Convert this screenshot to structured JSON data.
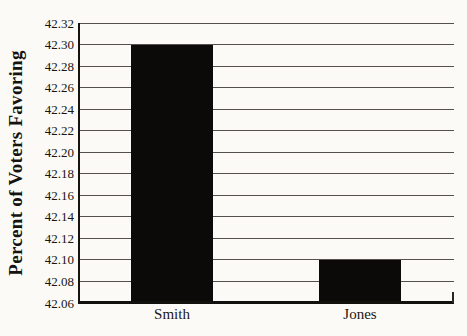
{
  "chart_data": {
    "type": "bar",
    "categories": [
      "Smith",
      "Jones"
    ],
    "values": [
      42.3,
      42.1
    ],
    "title": "",
    "xlabel": "",
    "ylabel": "Percent of Voters Favoring",
    "ylim": [
      42.06,
      42.32
    ],
    "ytick_step": 0.02,
    "yticks": [
      42.32,
      42.3,
      42.28,
      42.26,
      42.24,
      42.22,
      42.2,
      42.18,
      42.16,
      42.14,
      42.12,
      42.1,
      42.08,
      42.06
    ],
    "grid": true,
    "legend": "none",
    "bar_color": "#0b0a09",
    "background_color": "#fbfaf7",
    "gridline_color": "#54504c"
  }
}
